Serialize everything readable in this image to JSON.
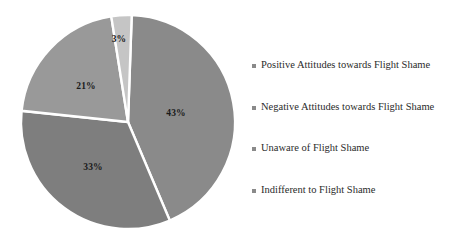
{
  "chart_data": {
    "type": "pie",
    "title": "",
    "subtitle": "",
    "xlabel": "",
    "ylabel": "",
    "grid": false,
    "legend_position": "right",
    "value_suffix": "%",
    "categories": [
      "Positive Attitudes towards Flight Shame",
      "Negative Attitudes towards Flight Shame",
      "Unaware of Flight Shame",
      "Indifferent to Flight Shame"
    ],
    "values": [
      43,
      33,
      21,
      3
    ],
    "data_labels": [
      "43%",
      "33%",
      "21%",
      "3%"
    ],
    "slice_colors": [
      "#8a8a8a",
      "#7e7e7e",
      "#999999",
      "#c5c5c5"
    ],
    "separator_color": "#ffffff",
    "slices": [
      {
        "label": "Positive Attitudes towards Flight Shame",
        "value": 43,
        "data_label": "43%",
        "color": "#8a8a8a",
        "start_angle": 2,
        "end_angle": 157,
        "label_x": 176,
        "label_y": 113
      },
      {
        "label": "Negative Attitudes towards Flight Shame",
        "value": 33,
        "data_label": "33%",
        "color": "#7e7e7e",
        "start_angle": 157,
        "end_angle": 276,
        "label_x": 93,
        "label_y": 167
      },
      {
        "label": "Unaware of Flight Shame",
        "value": 21,
        "data_label": "21%",
        "color": "#999999",
        "start_angle": 276,
        "end_angle": 351,
        "label_x": 86,
        "label_y": 86
      },
      {
        "label": "Indifferent to Flight Shame",
        "value": 3,
        "data_label": "3%",
        "color": "#c5c5c5",
        "start_angle": 351,
        "end_angle": 362,
        "label_x": 119,
        "label_y": 39
      }
    ],
    "geometry": {
      "center_x": 128,
      "center_y": 122,
      "radius": 107
    }
  },
  "legend": {
    "items": [
      {
        "label": "Positive Attitudes towards Flight Shame",
        "color": "#8a8a8a",
        "marker": "square-marker",
        "top": 12
      },
      {
        "label": "Negative Attitudes towards Flight Shame",
        "color": "#8a8a8a",
        "marker": "square-marker",
        "top": 54
      },
      {
        "label": "Unaware of Flight Shame",
        "color": "#8a8a8a",
        "marker": "square-marker",
        "top": 95
      },
      {
        "label": "Indifferent to Flight Shame",
        "color": "#8a8a8a",
        "marker": "square-marker",
        "top": 137
      }
    ]
  }
}
